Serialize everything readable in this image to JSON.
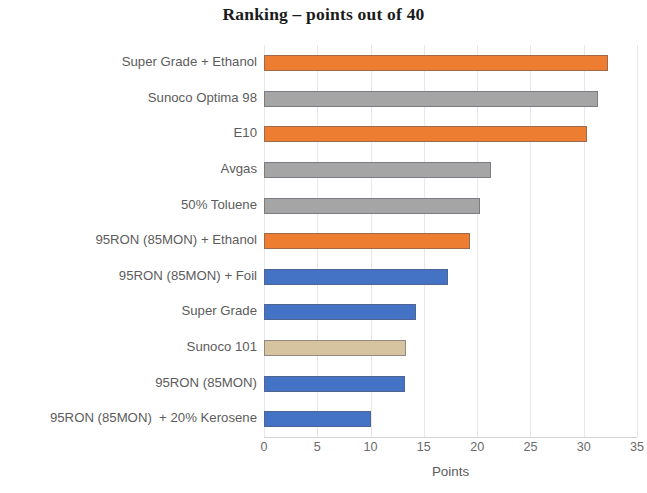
{
  "chart_data": {
    "type": "bar",
    "orientation": "horizontal",
    "title": "Ranking – points out of 40",
    "xlabel": "Points",
    "ylabel": "",
    "xlim": [
      0,
      35
    ],
    "xticks": [
      0,
      5,
      10,
      15,
      20,
      25,
      30,
      35
    ],
    "xtick_labels": [
      "0",
      "5",
      "10",
      "15",
      "20",
      "25",
      "30",
      "35"
    ],
    "grid": "vertical",
    "legend": "none",
    "categories": [
      "Super Grade + Ethanol",
      "Sunoco Optima 98",
      "E10",
      "Avgas",
      "50% Toluene",
      "95RON (85MON) + Ethanol",
      "95RON (85MON) + Foil",
      "Super Grade",
      "Sunoco 101",
      "95RON (85MON)",
      "95RON (85MON)  + 20% Kerosene"
    ],
    "values": [
      32.3,
      31.3,
      30.3,
      21.3,
      20.3,
      19.3,
      17.3,
      14.3,
      13.3,
      13.2,
      10
    ],
    "bar_colors": [
      "#ED7D31",
      "#A5A5A5",
      "#ED7D31",
      "#A5A5A5",
      "#A5A5A5",
      "#ED7D31",
      "#4472C4",
      "#4472C4",
      "#D6C3A0",
      "#4472C4",
      "#4472C4"
    ],
    "colors": {
      "orange": "#ED7D31",
      "gray": "#A5A5A5",
      "blue": "#4472C4",
      "tan": "#D6C3A0",
      "gridline": "#E8E8E8",
      "text": "#5C5C5C",
      "title": "#1B1B1B",
      "background": "#FFFFFF"
    }
  }
}
